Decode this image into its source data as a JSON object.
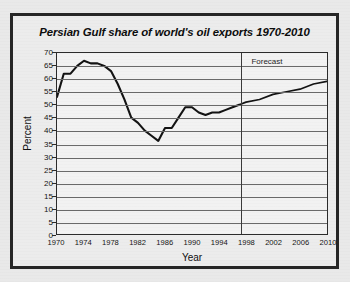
{
  "figure": {
    "title": "Persian Gulf share of world's oil exports 1970-2010",
    "annotation_forecast": "Forecast",
    "background_color": "#ececec",
    "border_color": "#262626",
    "line_color": "#131313"
  },
  "chart_data": {
    "type": "line",
    "title": "Persian Gulf share of world's oil exports 1970-2010",
    "xlabel": "Year",
    "ylabel": "Percent",
    "xlim": [
      1970,
      2010
    ],
    "ylim": [
      0,
      70
    ],
    "grid": true,
    "legend_position": "none",
    "x_ticks": [
      1970,
      1974,
      1978,
      1982,
      1986,
      1990,
      1994,
      1998,
      2002,
      2006,
      2010
    ],
    "y_ticks": [
      0,
      5,
      10,
      15,
      20,
      25,
      30,
      35,
      40,
      45,
      50,
      55,
      60,
      65,
      70
    ],
    "annotations": [
      {
        "text": "Forecast",
        "x": 1998,
        "y": 67,
        "divider_x": 1997
      }
    ],
    "series": [
      {
        "name": "Persian Gulf share of world oil exports",
        "segment": "historical",
        "x": [
          1970,
          1971,
          1972,
          1973,
          1974,
          1975,
          1976,
          1977,
          1978,
          1979,
          1980,
          1981,
          1982,
          1983,
          1984,
          1985,
          1986,
          1987,
          1988,
          1989,
          1990,
          1991,
          1992,
          1993,
          1994,
          1995,
          1996,
          1997
        ],
        "values": [
          53,
          62,
          62,
          65,
          67,
          66,
          66,
          65,
          63,
          58,
          52,
          45,
          43,
          40,
          38,
          36,
          41,
          41,
          45,
          49,
          49,
          47,
          46,
          47,
          47,
          48,
          49,
          50
        ]
      },
      {
        "name": "Forecast",
        "segment": "forecast",
        "x": [
          1997,
          1998,
          2000,
          2002,
          2004,
          2006,
          2008,
          2010
        ],
        "values": [
          50,
          51,
          52,
          54,
          55,
          56,
          58,
          59
        ]
      }
    ]
  }
}
